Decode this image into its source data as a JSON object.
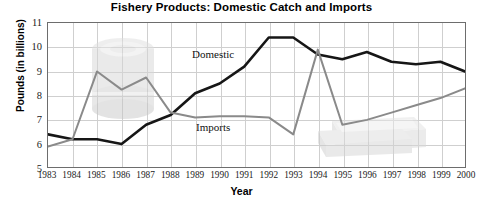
{
  "chart_data": {
    "type": "line",
    "title": "Fishery Products: Domestic Catch and Imports",
    "xlabel": "Year",
    "ylabel": "Pounds (in billions)",
    "ylim": [
      5,
      11
    ],
    "ytick_values": [
      5,
      6,
      7,
      8,
      9,
      10,
      11
    ],
    "ytick_labels": [
      "5",
      "6",
      "7",
      "8",
      "9",
      "10",
      "11"
    ],
    "grid": true,
    "legend_position": "inline-annotations",
    "categories": [
      "1983",
      "1984",
      "1985",
      "1986",
      "1987",
      "1988",
      "1989",
      "1990",
      "1991",
      "1992",
      "1993",
      "1994",
      "1995",
      "1996",
      "1997",
      "1998",
      "1999",
      "2000"
    ],
    "series": [
      {
        "name": "Domestic",
        "color": "#161616",
        "values": [
          6.4,
          6.2,
          6.2,
          6.0,
          6.8,
          7.2,
          8.1,
          8.5,
          9.2,
          10.4,
          10.4,
          9.7,
          9.5,
          9.8,
          9.4,
          9.3,
          9.4,
          9.0
        ]
      },
      {
        "name": "Imports",
        "color": "#8a8a8a",
        "values": [
          5.9,
          6.2,
          9.0,
          8.25,
          8.75,
          7.3,
          7.1,
          7.15,
          7.15,
          7.1,
          6.4,
          9.9,
          6.8,
          7.0,
          7.3,
          7.6,
          7.9,
          8.3
        ]
      }
    ],
    "annotations": [
      {
        "text": "Domestic",
        "series": "Domestic"
      },
      {
        "text": "Imports",
        "series": "Imports"
      }
    ],
    "watermarks": [
      {
        "name": "canned-fish-cylinder",
        "position": "left"
      },
      {
        "name": "shipping-crate",
        "position": "right"
      }
    ]
  },
  "axis_title_x": "Year",
  "axis_title_y": "Pounds (in billions)"
}
